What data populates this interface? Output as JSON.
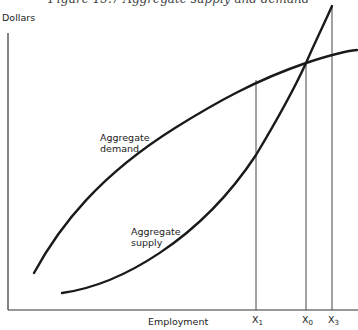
{
  "figure": {
    "title": "Figure 15.7 Aggregate supply and demand",
    "y_axis_label": "Dollars",
    "x_axis_label": "Employment",
    "curves": [
      {
        "name": "Aggregate demand",
        "label_line1": "Aggregate",
        "label_line2": "demand"
      },
      {
        "name": "Aggregate supply",
        "label_line1": "Aggregate",
        "label_line2": "supply"
      }
    ],
    "ticks": [
      {
        "label": "X",
        "sub": "1"
      },
      {
        "label": "X",
        "sub": "0"
      },
      {
        "label": "X",
        "sub": "3"
      }
    ],
    "colors": {
      "curve": "#1a1a1a",
      "axis": "#333333",
      "guide": "#444444"
    }
  }
}
